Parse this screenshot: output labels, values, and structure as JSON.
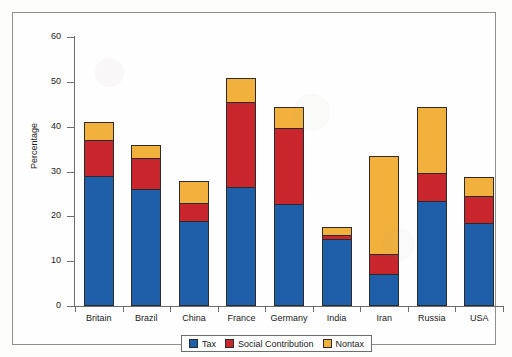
{
  "chart_data": {
    "type": "bar",
    "subtype": "stacked-bar",
    "title": "",
    "xlabel": "",
    "ylabel": "Percentage",
    "ylim": [
      0,
      60
    ],
    "yticks": [
      0,
      10,
      20,
      30,
      40,
      50,
      60
    ],
    "grid": false,
    "legend_position": "bottom",
    "categories": [
      "Britain",
      "Brazil",
      "China",
      "France",
      "Germany",
      "India",
      "Iran",
      "Russia",
      "USA"
    ],
    "series": [
      {
        "name": "Tax",
        "color": "#1F5FA9",
        "values": [
          29.0,
          26.0,
          19.0,
          26.5,
          22.7,
          14.9,
          7.1,
          23.5,
          18.6
        ]
      },
      {
        "name": "Social Contribution",
        "color": "#C8252C",
        "values": [
          8.0,
          7.0,
          4.0,
          19.0,
          17.0,
          0.9,
          4.5,
          6.2,
          5.9
        ]
      },
      {
        "name": "Nontax",
        "color": "#F2B13C",
        "values": [
          4.0,
          3.0,
          4.8,
          5.3,
          4.7,
          1.8,
          21.9,
          14.8,
          4.2
        ]
      }
    ],
    "totals": [
      41.0,
      36.0,
      27.8,
      50.8,
      44.4,
      17.6,
      33.5,
      44.5,
      28.7
    ]
  },
  "legend": {
    "entries": [
      {
        "label": "Tax",
        "color": "#1F5FA9"
      },
      {
        "label": "Social Contribution",
        "color": "#C8252C"
      },
      {
        "label": "Nontax",
        "color": "#F2B13C"
      }
    ]
  },
  "axis": {
    "y_title": "Percentage",
    "y_tick_labels": [
      "0",
      "10",
      "20",
      "30",
      "40",
      "50",
      "60"
    ]
  }
}
